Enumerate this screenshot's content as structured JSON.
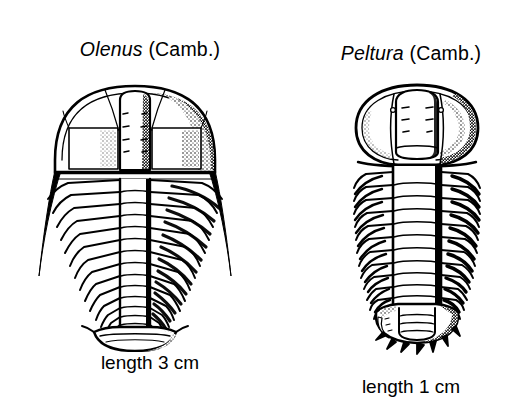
{
  "page": {
    "background_color": "#ffffff",
    "ink_color": "#000000",
    "kind": "scientific-illustration"
  },
  "figures": [
    {
      "id": "olenus",
      "genus": "Olenus",
      "age": "(Camb.)",
      "caption": "length 3 cm",
      "icon_name": "trilobite-olenus-drawing",
      "morphology": {
        "outline": "broad semicircular cephalon, tapering thorax, small rounded pygidium",
        "thorax_segments": 14,
        "genal_spines": 2,
        "genal_spine_style": "long slender backward-pointing",
        "glabella": "tall rectangular with faint lateral furrows",
        "axis_width_ratio": 0.22
      }
    },
    {
      "id": "peltura",
      "genus": "Peltura",
      "age": "(Camb.)",
      "caption": "length 1 cm",
      "icon_name": "trilobite-peltura-drawing",
      "morphology": {
        "outline": "wide bulbous cephalon, parallel-sided thorax, small spiny pygidium",
        "thorax_segments": 12,
        "genal_spines": 0,
        "genal_spine_style": "rounded genal angles, no long spines",
        "glabella": "broad rounded with faint lateral furrows",
        "axis_width_ratio": 0.34,
        "pygidium_marginal_spines": 7
      }
    }
  ]
}
